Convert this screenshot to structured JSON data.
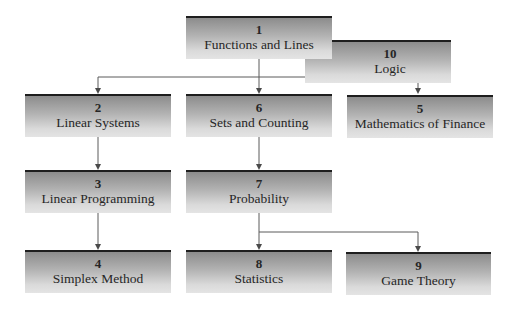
{
  "diagram": {
    "type": "chapter-dependency-flowchart",
    "nodes": [
      {
        "id": "1",
        "number": "1",
        "title": "Functions and Lines"
      },
      {
        "id": "10",
        "number": "10",
        "title": "Logic"
      },
      {
        "id": "2",
        "number": "2",
        "title": "Linear Systems"
      },
      {
        "id": "6",
        "number": "6",
        "title": "Sets and Counting"
      },
      {
        "id": "5",
        "number": "5",
        "title": "Mathematics of Finance"
      },
      {
        "id": "3",
        "number": "3",
        "title": "Linear Programming"
      },
      {
        "id": "7",
        "number": "7",
        "title": "Probability"
      },
      {
        "id": "4",
        "number": "4",
        "title": "Simplex Method"
      },
      {
        "id": "8",
        "number": "8",
        "title": "Statistics"
      },
      {
        "id": "9",
        "number": "9",
        "title": "Game Theory"
      }
    ],
    "edges": [
      {
        "from": "1",
        "to": "2"
      },
      {
        "from": "1",
        "to": "6"
      },
      {
        "from": "1",
        "to": "5"
      },
      {
        "from": "2",
        "to": "3"
      },
      {
        "from": "6",
        "to": "7"
      },
      {
        "from": "3",
        "to": "4"
      },
      {
        "from": "7",
        "to": "8"
      },
      {
        "from": "7",
        "to": "9"
      }
    ],
    "colors": {
      "box_top_border": "#1e1e1e",
      "box_gradient_top": "#8c8c8c",
      "box_gradient_bottom": "#e4e4e4",
      "connector": "#5a5a5a",
      "text": "#262626"
    }
  }
}
